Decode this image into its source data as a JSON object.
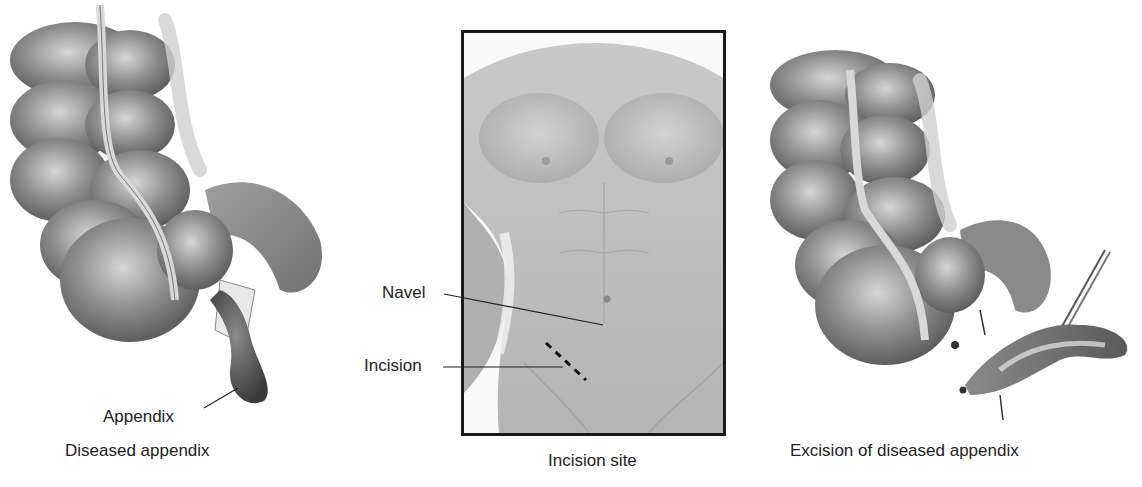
{
  "figure": {
    "panels": [
      {
        "id": "diseased",
        "caption": "Diseased appendix",
        "labels": [
          {
            "text": "Appendix"
          }
        ]
      },
      {
        "id": "incision-site",
        "caption": "Incision site",
        "labels": [
          {
            "text": "Navel"
          },
          {
            "text": "Incision"
          }
        ]
      },
      {
        "id": "excision",
        "caption": "Excision of diseased appendix",
        "labels": []
      }
    ],
    "colors": {
      "background": "#ffffff",
      "text": "#222222",
      "frame": "#1a1a1a",
      "tissue_dark": "#5a5a5a",
      "tissue_mid": "#8a8a8a",
      "tissue_light": "#c8c8c8",
      "skin": "#bdbdbd"
    }
  }
}
